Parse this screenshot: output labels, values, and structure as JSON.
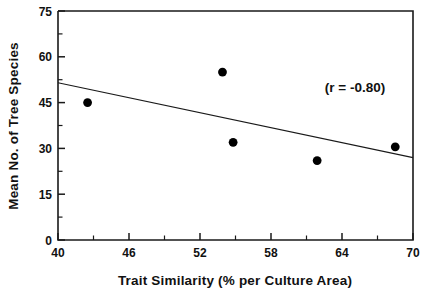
{
  "chart_data": {
    "type": "scatter",
    "title": "",
    "xlabel": "Trait Similarity (% per Culture Area)",
    "ylabel": "Mean No. of Tree Species",
    "xlim": [
      40,
      70
    ],
    "ylim": [
      0,
      75
    ],
    "xticks": [
      40,
      46,
      52,
      58,
      64,
      70
    ],
    "yticks": [
      0,
      15,
      30,
      45,
      60,
      75
    ],
    "xtick_labels": [
      "40",
      "46",
      "52",
      "58",
      "64",
      "70"
    ],
    "ytick_labels": [
      "0",
      "15",
      "30",
      "45",
      "60",
      "75"
    ],
    "grid": false,
    "legend": null,
    "minor_ticks": true,
    "points": [
      {
        "x": 42.5,
        "y": 45.0
      },
      {
        "x": 53.9,
        "y": 55.0
      },
      {
        "x": 54.8,
        "y": 32.0
      },
      {
        "x": 61.9,
        "y": 26.0
      },
      {
        "x": 68.5,
        "y": 30.5
      }
    ],
    "series": [
      {
        "name": "observations",
        "x": [
          42.5,
          53.9,
          54.8,
          61.9,
          68.5
        ],
        "values": [
          45.0,
          55.0,
          32.0,
          26.0,
          30.5
        ]
      }
    ],
    "trendline": {
      "type": "linear-fit",
      "x_start": 40,
      "y_start": 51.5,
      "x_end": 70,
      "y_end": 27.0
    },
    "annotations": [
      {
        "name": "correlation-annotation",
        "text": "(r = -0.80)",
        "x": 63.0,
        "y": 48.0
      }
    ],
    "correlation_r": -0.8
  },
  "colors": {
    "axis": "#1a1a1a",
    "point": "#000000",
    "line": "#1a1a1a",
    "text": "#111111",
    "background": "#ffffff"
  }
}
